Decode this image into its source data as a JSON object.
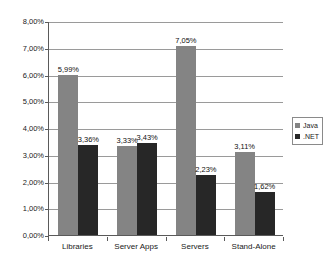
{
  "chart_data": {
    "type": "bar",
    "title": "",
    "subtitle": "",
    "xlabel": "",
    "ylabel": "",
    "categories": [
      "Libraries",
      "Server Apps",
      "Servers",
      "Stand-Alone"
    ],
    "series": [
      {
        "name": "Java",
        "color": "#848484",
        "values": [
          5.99,
          3.33,
          7.05,
          3.11
        ],
        "labels": [
          "5,99%",
          "3,33%",
          "7,05%",
          "3,11%"
        ]
      },
      {
        "name": ".NET",
        "color": "#272727",
        "values": [
          3.36,
          3.43,
          2.23,
          1.62
        ],
        "labels": [
          "3,36%",
          "3,43%",
          "2,23%",
          "1,62%"
        ]
      }
    ],
    "ylim": [
      0,
      8
    ],
    "ytick_values": [
      0,
      1,
      2,
      3,
      4,
      5,
      6,
      7,
      8
    ],
    "ytick_labels": [
      "0,00%",
      "1,00%",
      "2,00%",
      "3,00%",
      "4,00%",
      "5,00%",
      "6,00%",
      "7,00%",
      "8,00%"
    ],
    "grid": "horizontal",
    "legend_position": "right",
    "legend_entries": [
      "Java",
      ".NET"
    ],
    "value_labels_shown": true,
    "decimal_separator": ","
  },
  "legend": {
    "items": [
      {
        "label": "Java",
        "swatch": "java"
      },
      {
        "label": ".NET",
        "swatch": "dotnet"
      }
    ]
  }
}
